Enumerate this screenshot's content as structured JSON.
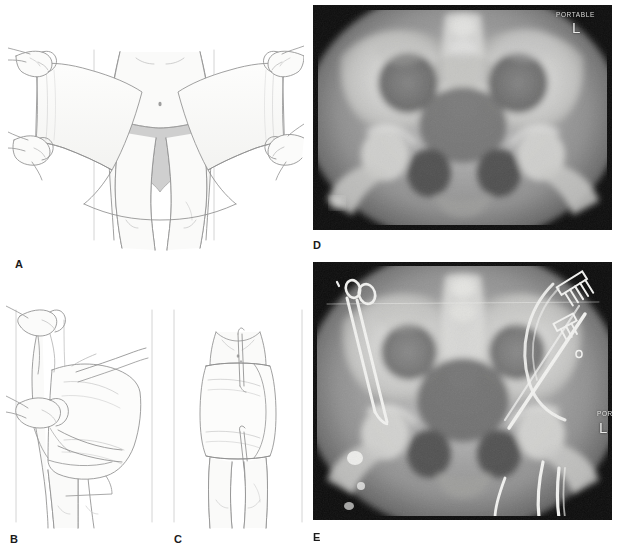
{
  "figure": {
    "width": 618,
    "height": 550,
    "background": "#ffffff",
    "type": "medical-illustration-plate"
  },
  "panels": [
    {
      "id": "A",
      "label": "A",
      "kind": "line-drawing",
      "caption_text": "",
      "description": "Frontal view: two pairs of gloved hands hold an open sheet spread behind and around the patient's pelvis; patient stands with underwear visible.",
      "x": 8,
      "y": 12,
      "width": 296,
      "height": 240,
      "label_x": 15,
      "label_y": 259
    },
    {
      "id": "B",
      "label": "B",
      "kind": "line-drawing",
      "caption_text": "",
      "description": "Oblique/side view: hands pull the sheet taut and cross the ends over the greater trochanters to compress the pelvis.",
      "x": 6,
      "y": 300,
      "width": 152,
      "height": 230,
      "label_x": 10,
      "label_y": 534
    },
    {
      "id": "C",
      "label": "C",
      "kind": "line-drawing",
      "caption_text": "",
      "description": "Posterior/frontal view: the wrapped sheet is secured in place with clamps at the midline, forming a snug pelvic binder.",
      "x": 168,
      "y": 300,
      "width": 140,
      "height": 230,
      "label_x": 174,
      "label_y": 534
    },
    {
      "id": "D",
      "label": "D",
      "kind": "radiograph",
      "caption_text": "",
      "description": "AP portable pelvis radiograph showing an open-book pelvic ring injury with widened symphysis pubis and sacroiliac diastasis.",
      "x": 313,
      "y": 5,
      "width": 299,
      "height": 225,
      "label_x": 313,
      "label_y": 240,
      "markers": [
        {
          "name": "portable-marker",
          "text": "PORTABLE",
          "x": 243,
          "y": 6,
          "style": "marker-portable"
        },
        {
          "name": "left-side-marker",
          "text": "L",
          "x": 259,
          "y": 14,
          "style": "marker-side"
        }
      ]
    },
    {
      "id": "E",
      "label": "E",
      "kind": "radiograph",
      "caption_text": "",
      "description": "Follow-up AP portable pelvis radiograph after binder and resuscitation; surgical clamps, ECG leads, tubing and lines overlie the field, with reduced pelvic ring diastasis.",
      "x": 313,
      "y": 262,
      "width": 299,
      "height": 258,
      "label_x": 313,
      "label_y": 532,
      "markers": [
        {
          "name": "portable-marker",
          "text": "POR",
          "x": 284,
          "y": 148,
          "style": "marker-portable"
        },
        {
          "name": "left-side-marker",
          "text": "L",
          "x": 286,
          "y": 157,
          "style": "marker-side"
        }
      ]
    }
  ]
}
